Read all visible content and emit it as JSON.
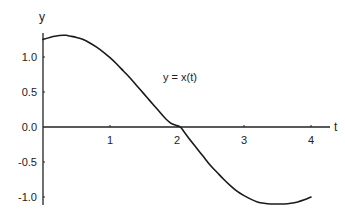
{
  "chart_data": {
    "type": "line",
    "title": "",
    "xlabel": "t",
    "ylabel": "y",
    "xlim": [
      0,
      4.15
    ],
    "ylim": [
      -1.1,
      1.35
    ],
    "grid": false,
    "legend": null,
    "x_ticks": [
      1,
      2,
      3,
      4
    ],
    "x_tick_labels": [
      "1",
      "2",
      "3",
      "4"
    ],
    "y_ticks": [
      1.0,
      0.5,
      0.0,
      -0.5,
      -1.0
    ],
    "y_tick_labels": [
      "1.0",
      "0.5",
      "0.0",
      "-0.5",
      "-1.0"
    ],
    "annotations": [
      {
        "text": "y = x(t)",
        "x": 2.25,
        "y": 0.85
      }
    ],
    "series": [
      {
        "name": "y = x(t)",
        "color": "#1a1a1a",
        "x": [
          0.0,
          0.1,
          0.2,
          0.3,
          0.35,
          0.4,
          0.5,
          0.6,
          0.7,
          0.8,
          0.9,
          1.0,
          1.1,
          1.2,
          1.3,
          1.4,
          1.5,
          1.6,
          1.7,
          1.8,
          1.9,
          2.0,
          2.05,
          2.1,
          2.2,
          2.3,
          2.4,
          2.5,
          2.6,
          2.7,
          2.8,
          2.9,
          3.0,
          3.1,
          3.2,
          3.3,
          3.4,
          3.5,
          3.6,
          3.7,
          3.8,
          3.9,
          4.0
        ],
        "values": [
          1.25,
          1.28,
          1.3,
          1.31,
          1.31,
          1.3,
          1.28,
          1.25,
          1.2,
          1.14,
          1.07,
          0.99,
          0.9,
          0.8,
          0.7,
          0.59,
          0.48,
          0.37,
          0.26,
          0.15,
          0.06,
          0.02,
          0.0,
          -0.06,
          -0.19,
          -0.31,
          -0.43,
          -0.55,
          -0.65,
          -0.75,
          -0.84,
          -0.92,
          -0.98,
          -1.03,
          -1.07,
          -1.09,
          -1.1,
          -1.1,
          -1.1,
          -1.09,
          -1.07,
          -1.04,
          -1.0
        ]
      }
    ]
  }
}
